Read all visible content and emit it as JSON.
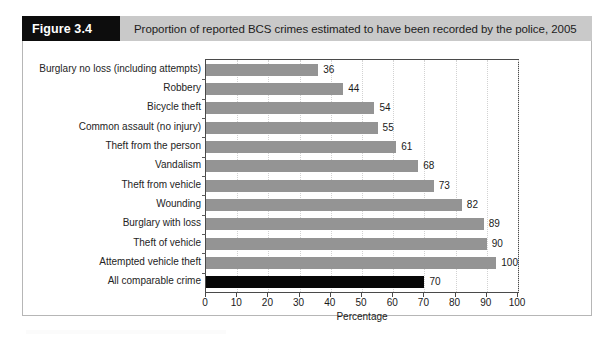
{
  "figure": {
    "number_label": "Figure 3.4",
    "title": "Proportion of reported BCS crimes estimated to have been recorded by the police, 2005"
  },
  "colors": {
    "bar": "#949494",
    "highlight_bar": "#070707",
    "header_band": "#c9c9c9",
    "number_box": "#0d0d0d",
    "axis": "#4a4a4a",
    "gridline": "#d2d2d2"
  },
  "chart_data": {
    "type": "bar",
    "orientation": "horizontal",
    "title": "Proportion of reported BCS crimes estimated to have been recorded by the police, 2005",
    "xlabel": "Percentage",
    "ylabel": "",
    "xlim": [
      0,
      100
    ],
    "xticks": [
      0,
      10,
      20,
      30,
      40,
      50,
      60,
      70,
      80,
      90,
      100
    ],
    "grid": true,
    "grid_axis": "x",
    "legend": "none",
    "categories": [
      "Burglary no loss (including attempts)",
      "Robbery",
      "Bicycle theft",
      "Common assault (no injury)",
      "Theft from the person",
      "Vandalism",
      "Theft from vehicle",
      "Wounding",
      "Burglary with loss",
      "Theft of vehicle",
      "Attempted vehicle theft",
      "All comparable crime"
    ],
    "values": [
      36,
      44,
      54,
      55,
      61,
      68,
      73,
      82,
      89,
      90,
      100,
      70
    ],
    "highlighted_categories": [
      "All comparable crime"
    ],
    "data_labels": [
      "36",
      "44",
      "54",
      "55",
      "61",
      "68",
      "73",
      "82",
      "89",
      "90",
      "100",
      "70"
    ]
  }
}
